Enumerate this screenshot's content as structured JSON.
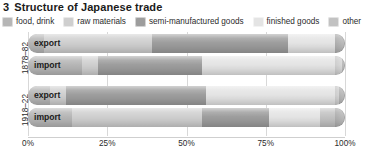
{
  "title": {
    "number": "3",
    "text": "Structure of Japanese trade"
  },
  "legend": {
    "items": [
      {
        "label": "food, drink",
        "key": "food_drink",
        "color": "#b6b6b6"
      },
      {
        "label": "raw materials",
        "key": "raw_materials",
        "color": "#cfcfcf"
      },
      {
        "label": "semi-manufactured goods",
        "key": "semi_manufactured",
        "color": "#9d9d9d"
      },
      {
        "label": "finished goods",
        "key": "finished_goods",
        "color": "#e4e4e4"
      },
      {
        "label": "other",
        "key": "other",
        "color": "#c2c2c2"
      }
    ]
  },
  "axis": {
    "ticks": [
      "0%",
      "25%",
      "50%",
      "75%",
      "100%"
    ],
    "tick_values": [
      0,
      25,
      50,
      75,
      100
    ],
    "min": 0,
    "max": 100
  },
  "groups": [
    {
      "label": "1878–82",
      "rows": [
        "export",
        "import"
      ]
    },
    {
      "label": "1918–22",
      "rows": [
        "export",
        "import"
      ]
    }
  ],
  "row_labels": {
    "export": "export",
    "import": "import"
  },
  "chart_data": {
    "type": "bar",
    "orientation": "horizontal",
    "stacked": true,
    "percent": true,
    "title": "Structure of Japanese trade",
    "xlabel": "",
    "ylabel": "",
    "xlim": [
      0,
      100
    ],
    "grid": true,
    "legend_position": "top",
    "categories": [
      "1878–82 export",
      "1878–82 import",
      "1918–22 export",
      "1918–22 import"
    ],
    "series": [
      {
        "name": "food, drink",
        "color": "#b6b6b6",
        "values": [
          5,
          17,
          7,
          14
        ]
      },
      {
        "name": "raw materials",
        "color": "#cfcfcf",
        "values": [
          34,
          5,
          5,
          41
        ]
      },
      {
        "name": "semi-manufactured goods",
        "color": "#9d9d9d",
        "values": [
          43,
          33,
          44,
          21
        ]
      },
      {
        "name": "finished goods",
        "color": "#e4e4e4",
        "values": [
          15,
          44,
          42,
          16
        ]
      },
      {
        "name": "other",
        "color": "#c2c2c2",
        "values": [
          3,
          1,
          2,
          8
        ]
      }
    ],
    "bars": [
      {
        "group": "1878–82",
        "row": "export",
        "segments": [
          {
            "name": "food, drink",
            "value": 5,
            "color": "#b6b6b6"
          },
          {
            "name": "raw materials",
            "value": 34,
            "color": "#cfcfcf"
          },
          {
            "name": "semi-manufactured goods",
            "value": 43,
            "color": "#9d9d9d"
          },
          {
            "name": "finished goods",
            "value": 15,
            "color": "#e4e4e4"
          },
          {
            "name": "other",
            "value": 3,
            "color": "#c2c2c2"
          }
        ]
      },
      {
        "group": "1878–82",
        "row": "import",
        "segments": [
          {
            "name": "food, drink",
            "value": 17,
            "color": "#b6b6b6"
          },
          {
            "name": "raw materials",
            "value": 5,
            "color": "#cfcfcf"
          },
          {
            "name": "semi-manufactured goods",
            "value": 33,
            "color": "#9d9d9d"
          },
          {
            "name": "finished goods",
            "value": 44,
            "color": "#e4e4e4"
          },
          {
            "name": "other",
            "value": 1,
            "color": "#c2c2c2"
          }
        ]
      },
      {
        "group": "1918–22",
        "row": "export",
        "segments": [
          {
            "name": "food, drink",
            "value": 7,
            "color": "#b6b6b6"
          },
          {
            "name": "raw materials",
            "value": 5,
            "color": "#cfcfcf"
          },
          {
            "name": "semi-manufactured goods",
            "value": 44,
            "color": "#9d9d9d"
          },
          {
            "name": "finished goods",
            "value": 42,
            "color": "#e4e4e4"
          },
          {
            "name": "other",
            "value": 2,
            "color": "#c2c2c2"
          }
        ]
      },
      {
        "group": "1918–22",
        "row": "import",
        "segments": [
          {
            "name": "food, drink",
            "value": 14,
            "color": "#b6b6b6"
          },
          {
            "name": "raw materials",
            "value": 41,
            "color": "#cfcfcf"
          },
          {
            "name": "semi-manufactured goods",
            "value": 21,
            "color": "#9d9d9d"
          },
          {
            "name": "finished goods",
            "value": 16,
            "color": "#e4e4e4"
          },
          {
            "name": "other",
            "value": 8,
            "color": "#c2c2c2"
          }
        ]
      }
    ]
  }
}
